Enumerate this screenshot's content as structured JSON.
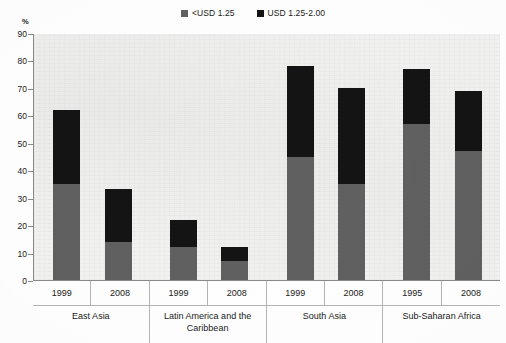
{
  "chart_data": {
    "type": "bar",
    "subtype": "stacked-bar",
    "title": "",
    "xlabel": "",
    "ylabel": "%",
    "ylim": [
      0,
      90
    ],
    "ytick_step": 10,
    "yticks": [
      90,
      80,
      70,
      60,
      50,
      40,
      30,
      20,
      10,
      0
    ],
    "grid": false,
    "legend_position": "top-center",
    "categories": [
      "East Asia 1999",
      "East Asia 2008",
      "Latin America and the Caribbean 1999",
      "Latin America and the Caribbean 2008",
      "South Asia 1999",
      "South Asia 2008",
      "Sub-Saharan Africa 1999",
      "Sub-Saharan Africa 2008"
    ],
    "series": [
      {
        "name": "<USD 1.25",
        "color": "#606060",
        "values": [
          35,
          14,
          12,
          7,
          45,
          35,
          57,
          47
        ]
      },
      {
        "name": "USD 1.25-2.00",
        "color": "#141414",
        "values": [
          27,
          19,
          10,
          5,
          33,
          35,
          20,
          22
        ]
      }
    ],
    "totals": [
      62,
      33,
      22,
      12,
      78,
      70,
      77,
      69
    ]
  },
  "legend": {
    "items": [
      {
        "label": "<USD 1.25",
        "color": "#606060"
      },
      {
        "label": "USD 1.25-2.00",
        "color": "#141414"
      }
    ]
  },
  "axis": {
    "unit": "%",
    "ticks": [
      "90",
      "80",
      "70",
      "60",
      "50",
      "40",
      "30",
      "20",
      "10",
      "0"
    ]
  },
  "groups": [
    {
      "name": "East Asia",
      "years": [
        "1999",
        "2008"
      ],
      "bars": [
        {
          "year": "1999",
          "low": 35,
          "high": 27,
          "total": 62
        },
        {
          "year": "2008",
          "low": 14,
          "high": 19,
          "total": 33
        }
      ]
    },
    {
      "name": "Latin America and the Caribbean",
      "years": [
        "1999",
        "2008"
      ],
      "bars": [
        {
          "year": "1999",
          "low": 12,
          "high": 10,
          "total": 22
        },
        {
          "year": "2008",
          "low": 7,
          "high": 5,
          "total": 12
        }
      ]
    },
    {
      "name": "South Asia",
      "years": [
        "1999",
        "2008"
      ],
      "bars": [
        {
          "year": "1999",
          "low": 45,
          "high": 33,
          "total": 78
        },
        {
          "year": "2008",
          "low": 35,
          "high": 35,
          "total": 70
        }
      ]
    },
    {
      "name": "Sub-Saharan Africa",
      "years": [
        "1995",
        "2008"
      ],
      "bars": [
        {
          "year": "1995",
          "low": 57,
          "high": 20,
          "total": 77
        },
        {
          "year": "2008",
          "low": 47,
          "high": 22,
          "total": 69
        }
      ]
    }
  ]
}
